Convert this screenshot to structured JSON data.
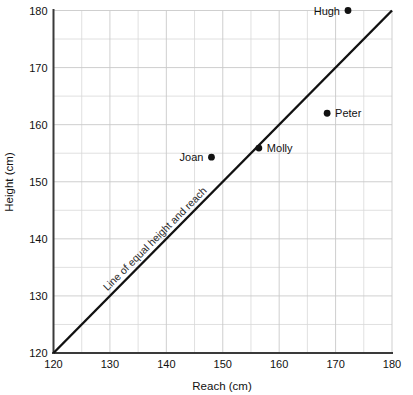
{
  "chart_data": {
    "type": "scatter",
    "title": "",
    "xlabel": "Reach (cm)",
    "ylabel": "Height (cm)",
    "xlim": [
      120,
      180
    ],
    "ylim": [
      120,
      180
    ],
    "xticks": [
      120,
      130,
      140,
      150,
      160,
      170,
      180
    ],
    "yticks": [
      120,
      130,
      140,
      150,
      160,
      170,
      180
    ],
    "xtick_labels": [
      "120",
      "130",
      "140",
      "150",
      "160",
      "170",
      "180"
    ],
    "ytick_labels": [
      "120",
      "130",
      "140",
      "150",
      "160",
      "170",
      "180"
    ],
    "minor_tick_step": 5,
    "grid": true,
    "legend": "none",
    "points": [
      {
        "name": "Hugh",
        "x": 172.2,
        "y": 180.0,
        "label_side": "left"
      },
      {
        "name": "Peter",
        "x": 168.5,
        "y": 162.0,
        "label_side": "right"
      },
      {
        "name": "Molly",
        "x": 156.4,
        "y": 155.9,
        "label_side": "right"
      },
      {
        "name": "Joan",
        "x": 148.0,
        "y": 154.3,
        "label_side": "left"
      }
    ],
    "annotations": [
      {
        "text": "Line of equal height and reach",
        "kind": "reference-line-label",
        "rotation_deg": -45,
        "x": 139.0,
        "y": 139.0
      }
    ],
    "reference_line": {
      "name": "line-of-equality",
      "from": [
        120,
        120
      ],
      "to": [
        180,
        180
      ],
      "color": "#111111"
    },
    "colors": {
      "point": "#111111",
      "axis": "#3a3a3a",
      "grid_minor": "#d8d8d8",
      "grid_major": "#c9c9c9",
      "background": "#ffffff",
      "text": "#111111"
    }
  }
}
